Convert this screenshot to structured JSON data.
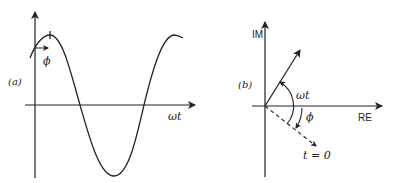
{
  "panels": [
    {
      "id": "a",
      "label": "(a)",
      "x_axis_label": "ωt",
      "phase_label": "ϕ",
      "curve": "sinusoid with phase shift ϕ"
    },
    {
      "id": "b",
      "label": "(b)",
      "x_axis_label": "RE",
      "y_axis_label": "IM",
      "angle_label": "ωt",
      "phase_label": "ϕ",
      "dashed_label": "t = 0"
    }
  ],
  "colors": {
    "ink": "#222222",
    "background": "#ffffff"
  }
}
